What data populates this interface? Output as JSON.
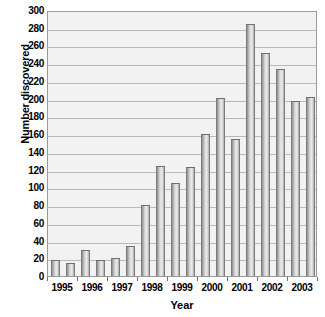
{
  "chart_data": {
    "type": "bar",
    "title": "",
    "xlabel": "Year",
    "ylabel": "Number discovered",
    "ylim": [
      0,
      300
    ],
    "ytick_step": 20,
    "grid": true,
    "legend": "none",
    "bars_per_category": 2,
    "categories": [
      "1995",
      "1996",
      "1997",
      "1998",
      "1999",
      "2000",
      "2001",
      "2002",
      "2003"
    ],
    "ytick_labels": [
      "300",
      "280",
      "260",
      "240",
      "220",
      "200",
      "180",
      "160",
      "140",
      "120",
      "100",
      "80",
      "60",
      "40",
      "20",
      "0"
    ],
    "series": [
      {
        "name": "first half",
        "values": [
          18,
          29,
          20,
          80,
          105,
          160,
          284,
          234,
          197
        ]
      },
      {
        "name": "second half",
        "values": [
          15,
          18,
          34,
          124,
          123,
          201,
          154,
          251,
          202
        ]
      }
    ],
    "bars": [
      {
        "label": "1995 a",
        "value": 18
      },
      {
        "label": "1995 b",
        "value": 15
      },
      {
        "label": "1996 a",
        "value": 29
      },
      {
        "label": "1996 b",
        "value": 18
      },
      {
        "label": "1997 a",
        "value": 20
      },
      {
        "label": "1997 b",
        "value": 34
      },
      {
        "label": "1998 a",
        "value": 80
      },
      {
        "label": "1998 b",
        "value": 124
      },
      {
        "label": "1999 a",
        "value": 105
      },
      {
        "label": "1999 b",
        "value": 123
      },
      {
        "label": "2000 a",
        "value": 160
      },
      {
        "label": "2000 b",
        "value": 201
      },
      {
        "label": "2001 a",
        "value": 154
      },
      {
        "label": "2001 b",
        "value": 284
      },
      {
        "label": "2002 a",
        "value": 251
      },
      {
        "label": "2002 b",
        "value": 234
      },
      {
        "label": "2003 a",
        "value": 197
      },
      {
        "label": "2003 b",
        "value": 202
      }
    ],
    "colors": {
      "plot_background": "#f2f2f2",
      "gridline": "#b9b9b9",
      "plot_border": "#9a9a9a",
      "bar_fill": "#d0d0d0",
      "bar_edge": "#7b7b7b",
      "text": "#000000",
      "page_background": "#ffffff"
    }
  }
}
